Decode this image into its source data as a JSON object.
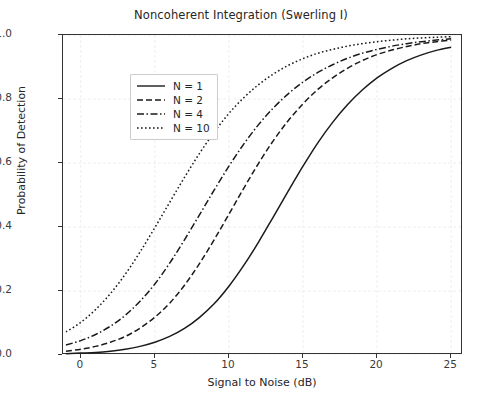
{
  "chart_data": {
    "type": "line",
    "title": "Noncoherent Integration (Swerling I)",
    "xlabel": "Signal to Noise (dB)",
    "ylabel": "Probability of Detection",
    "xlim": [
      -1.2,
      25.8
    ],
    "ylim": [
      0.0,
      1.0
    ],
    "xticks": [
      0,
      5,
      10,
      15,
      20,
      25
    ],
    "xtick_labels": [
      "0",
      "5",
      "10",
      "15",
      "20",
      "25"
    ],
    "yticks": [
      0.0,
      0.2,
      0.4,
      0.6,
      0.8,
      1.0
    ],
    "ytick_labels": [
      "0.0",
      "0.2",
      "0.4",
      "0.6",
      "0.8",
      "1.0"
    ],
    "grid": true,
    "grid_color": "#eeeeee",
    "legend_position": "upper left",
    "line_color": "#1a1a1a",
    "x": [
      -1,
      0,
      1,
      2,
      3,
      4,
      5,
      6,
      7,
      8,
      9,
      10,
      11,
      12,
      13,
      14,
      15,
      16,
      17,
      18,
      19,
      20,
      21,
      22,
      23,
      24,
      25
    ],
    "series": [
      {
        "name": "N = 1",
        "label": "N = 1",
        "linestyle": "solid",
        "dasharray": "",
        "values": [
          0.004,
          0.006,
          0.008,
          0.012,
          0.018,
          0.027,
          0.04,
          0.058,
          0.083,
          0.117,
          0.16,
          0.215,
          0.28,
          0.353,
          0.432,
          0.512,
          0.59,
          0.663,
          0.727,
          0.782,
          0.828,
          0.866,
          0.896,
          0.92,
          0.938,
          0.952,
          0.962
        ]
      },
      {
        "name": "N = 2",
        "label": "N = 2",
        "linestyle": "dashed",
        "dasharray": "6,3",
        "values": [
          0.012,
          0.018,
          0.027,
          0.04,
          0.058,
          0.084,
          0.118,
          0.162,
          0.218,
          0.285,
          0.36,
          0.44,
          0.521,
          0.599,
          0.67,
          0.732,
          0.785,
          0.83,
          0.866,
          0.896,
          0.92,
          0.939,
          0.953,
          0.964,
          0.973,
          0.979,
          0.984
        ]
      },
      {
        "name": "N = 4",
        "label": "N = 4",
        "linestyle": "dashdot",
        "dasharray": "7,2.5,1.5,2.5",
        "values": [
          0.031,
          0.045,
          0.064,
          0.09,
          0.124,
          0.168,
          0.222,
          0.287,
          0.36,
          0.437,
          0.515,
          0.59,
          0.659,
          0.72,
          0.772,
          0.816,
          0.853,
          0.883,
          0.907,
          0.927,
          0.943,
          0.955,
          0.965,
          0.973,
          0.979,
          0.984,
          0.988
        ]
      },
      {
        "name": "N = 10",
        "label": "N = 10",
        "linestyle": "dotted",
        "dasharray": "1.6,2.4",
        "values": [
          0.072,
          0.102,
          0.142,
          0.192,
          0.252,
          0.322,
          0.398,
          0.477,
          0.555,
          0.629,
          0.696,
          0.755,
          0.804,
          0.845,
          0.878,
          0.905,
          0.926,
          0.943,
          0.955,
          0.965,
          0.973,
          0.979,
          0.984,
          0.988,
          0.991,
          0.993,
          0.995
        ]
      }
    ]
  }
}
